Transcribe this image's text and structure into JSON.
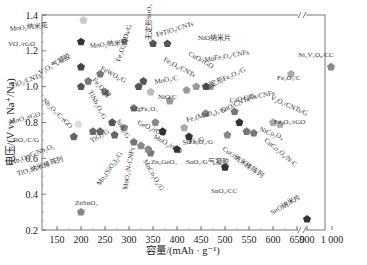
{
  "chart_data": {
    "type": "scatter",
    "title": "",
    "xlabel": "容量/(mAh · g⁻¹)",
    "ylabel": "电压/(V vs. Na⁺/Na)",
    "xlim": [
      125,
      1000
    ],
    "ylim": [
      0.2,
      1.4
    ],
    "x_axis_break": "between 650 and 900",
    "x_ticks": [
      "150",
      "200",
      "250",
      "300",
      "350",
      "400",
      "450",
      "500",
      "550",
      "600",
      "650",
      "900",
      "1 000"
    ],
    "y_ticks": [
      "0.2",
      "0.4",
      "0.6",
      "0.8",
      "1.0",
      "1.2",
      "1.4"
    ],
    "grid": false,
    "legend": "none (points labeled directly)",
    "points": [
      {
        "label": "MnO₂纳米花",
        "x": 205,
        "y": 1.37,
        "color": "#c8c8c8",
        "lx": 10,
        "ly": 31,
        "rot": -5
      },
      {
        "label": "MnO₂纳米管",
        "x": 290,
        "y": 1.25,
        "color": "#c8c8c8",
        "lx": 90,
        "ly": 48,
        "rot": -5
      },
      {
        "label": "VO₂/rGO",
        "x": 200,
        "y": 1.25,
        "color": "#333333",
        "lx": 8,
        "ly": 46,
        "rot": 0
      },
      {
        "label": "FeTiO₃/CNTs",
        "x": 350,
        "y": 1.24,
        "color": "#555555",
        "lx": 157,
        "ly": 37,
        "rot": -17
      },
      {
        "label": "NiO纳米片",
        "x": 380,
        "y": 1.24,
        "color": "#555555",
        "lx": 198,
        "ly": 40,
        "rot": 0
      },
      {
        "label": "V₂O₅气凝胶",
        "x": 200,
        "y": 1.11,
        "color": "#444444",
        "lx": 40,
        "ly": 75,
        "rot": -30
      },
      {
        "label": "FeWO₄/G",
        "x": 240,
        "y": 1.07,
        "color": "#777777",
        "lx": 100,
        "ly": 70,
        "rot": 28
      },
      {
        "label": "Fe₂O₃球",
        "x": 215,
        "y": 1.03,
        "color": "#777777",
        "lx": 92,
        "ly": 80,
        "rot": 50
      },
      {
        "label": "Fe₃O₄ QDs/G",
        "x": 320,
        "y": 1.0,
        "color": "#555555",
        "lx": 120,
        "ly": 62,
        "rot": -72
      },
      {
        "label": "无定形SnO₂",
        "x": 330,
        "y": 1.03,
        "color": "#555555",
        "lx": 151,
        "ly": 40,
        "rot": -90
      },
      {
        "label": "Fe₃O₄/CNTs",
        "x": 420,
        "y": 0.98,
        "color": "#999999",
        "lx": 163,
        "ly": 61,
        "rot": 28
      },
      {
        "label": "MoO₂/C",
        "x": 345,
        "y": 0.97,
        "color": "#bbbbbb",
        "lx": 155,
        "ly": 84,
        "rot": -10
      },
      {
        "label": "CuO/rGO",
        "x": 440,
        "y": 1.0,
        "color": "#999999",
        "lx": 188,
        "ly": 55,
        "rot": 30
      },
      {
        "label": "MnFe₂O₄/CNFs",
        "x": 470,
        "y": 1.0,
        "color": "#999999",
        "lx": 205,
        "ly": 62,
        "rot": -10
      },
      {
        "label": "无定形Fe₂O₃/G",
        "x": 460,
        "y": 1.0,
        "color": "#555555",
        "lx": 205,
        "ly": 90,
        "rot": -25
      },
      {
        "label": "Fe₂O₄/C",
        "x": 620,
        "y": 1.07,
        "color": "#aaaaaa",
        "lx": 277,
        "ly": 80,
        "rot": 0
      },
      {
        "label": "Ni₃V₂O₈/CC",
        "x": 960,
        "y": 1.11,
        "color": "#888888",
        "lx": 298,
        "ly": 57,
        "rot": 0
      },
      {
        "label": "TiO₂/CNTs",
        "x": 200,
        "y": 1.0,
        "color": "#555555",
        "lx": 12,
        "ly": 88,
        "rot": -20
      },
      {
        "label": "TiNb₂O₇/G",
        "x": 250,
        "y": 0.97,
        "color": "#777777",
        "lx": 88,
        "ly": 92,
        "rot": 62
      },
      {
        "label": "NiO/C",
        "x": 385,
        "y": 0.92,
        "color": "#999999",
        "lx": 158,
        "ly": 99,
        "rot": 0
      },
      {
        "label": "Nb₂O₅/C/rGO",
        "x": 265,
        "y": 0.8,
        "color": "#555555",
        "lx": 42,
        "ly": 101,
        "rot": 45
      },
      {
        "label": "MoO₃/rGO",
        "x": 195,
        "y": 0.79,
        "color": "#dddddd",
        "lx": 10,
        "ly": 124,
        "rot": -14
      },
      {
        "label": "MgFe₂O₄",
        "x": 310,
        "y": 0.88,
        "color": "#777777",
        "lx": 131,
        "ly": 111,
        "rot": 0
      },
      {
        "label": "Fe₂(MoO₄)₃/G",
        "x": 460,
        "y": 0.85,
        "color": "#888888",
        "lx": 187,
        "ly": 122,
        "rot": -15
      },
      {
        "label": "CaO QDs/CNFs",
        "x": 520,
        "y": 0.86,
        "color": "#777777",
        "lx": 230,
        "ly": 103,
        "rot": -10
      },
      {
        "label": "SnO/CNTs/G",
        "x": 530,
        "y": 0.8,
        "color": "#333333",
        "lx": 222,
        "ly": 113,
        "rot": -25
      },
      {
        "label": "V₂O₅/CNTs/G",
        "x": 600,
        "y": 0.8,
        "color": "#aaaaaa",
        "lx": 270,
        "ly": 99,
        "rot": 25
      },
      {
        "label": "Fe₂O₃/rGO",
        "x": 615,
        "y": 0.79,
        "color": "#aaaaaa",
        "lx": 274,
        "ly": 124,
        "rot": 0
      },
      {
        "label": "Fe₂O₃/G",
        "x": 415,
        "y": 0.77,
        "color": "#aaaaaa",
        "lx": 189,
        "ly": 144,
        "rot": 0
      },
      {
        "label": "GeO₂/rGO",
        "x": 355,
        "y": 0.8,
        "color": "#888888",
        "lx": 137,
        "ly": 124,
        "rot": 25
      },
      {
        "label": "SnS₂/G",
        "x": 290,
        "y": 0.77,
        "color": "#888888",
        "lx": 116,
        "ly": 121,
        "rot": 60
      },
      {
        "label": "NiCo₂O₄",
        "x": 545,
        "y": 0.75,
        "color": "#777777",
        "lx": 259,
        "ly": 131,
        "rot": 20
      },
      {
        "label": "CuCo₂O₄/N-C",
        "x": 560,
        "y": 0.74,
        "color": "#777777",
        "lx": 264,
        "ly": 141,
        "rot": 40
      },
      {
        "label": "CuO纳米棒阵列",
        "x": 505,
        "y": 0.73,
        "color": "#888888",
        "lx": 222,
        "ly": 150,
        "rot": 35
      },
      {
        "label": "TiO₂/C/G",
        "x": 185,
        "y": 0.72,
        "color": "#666666",
        "lx": 12,
        "ly": 142,
        "rot": 0
      },
      {
        "label": "TiO₂/G",
        "x": 240,
        "y": 0.75,
        "color": "#666666",
        "lx": 92,
        "ly": 143,
        "rot": -30
      },
      {
        "label": "Nb₂O₅/G/Nb₂O₅",
        "x": 225,
        "y": 0.75,
        "color": "#666666",
        "lx": 12,
        "ly": 165,
        "rot": -22
      },
      {
        "label": "TiO₂纳米棒阵列",
        "x": 270,
        "y": 0.73,
        "color": "#666666",
        "lx": 18,
        "ly": 176,
        "rot": -18
      },
      {
        "label": "MoO₂/rGO",
        "x": 370,
        "y": 0.75,
        "color": "#333333",
        "lx": 153,
        "ly": 138,
        "rot": 30
      },
      {
        "label": "SnO₂/G",
        "x": 425,
        "y": 0.72,
        "color": "#333333",
        "lx": 183,
        "ly": 145,
        "rot": -10
      },
      {
        "label": "Mn₃(SiO₄)₂/G",
        "x": 310,
        "y": 0.69,
        "color": "#777777",
        "lx": 100,
        "ly": 186,
        "rot": -55
      },
      {
        "label": "MoO₂/N-CNFs",
        "x": 325,
        "y": 0.67,
        "color": "#888888",
        "lx": 127,
        "ly": 190,
        "rot": -80
      },
      {
        "label": "MnCo₂O₄/G",
        "x": 345,
        "y": 0.63,
        "color": "#777777",
        "lx": 143,
        "ly": 161,
        "rot": 60
      },
      {
        "label": "Zn₂GeO₄",
        "x": 340,
        "y": 0.65,
        "color": "#888888",
        "lx": 151,
        "ly": 164,
        "rot": 0
      },
      {
        "label": "SnO₂/G气凝胶",
        "x": 400,
        "y": 0.65,
        "color": "#333333",
        "lx": 186,
        "ly": 164,
        "rot": 0
      },
      {
        "label": "SnO₂/CC",
        "x": 500,
        "y": 0.55,
        "color": "#333333",
        "lx": 211,
        "ly": 193,
        "rot": 0
      },
      {
        "label": "ZnSnO₃",
        "x": 200,
        "y": 0.3,
        "color": "#888888",
        "lx": 75,
        "ly": 205,
        "rot": 0
      },
      {
        "label": "SnO纳米片",
        "x": 680,
        "y": 0.26,
        "color": "#333333",
        "lx": 272,
        "ly": 215,
        "rot": -30
      }
    ]
  },
  "axes": {
    "xlabel": "容量/(mAh · g⁻¹)",
    "ylabel": "电压/(V vs. Na⁺/Na)"
  }
}
